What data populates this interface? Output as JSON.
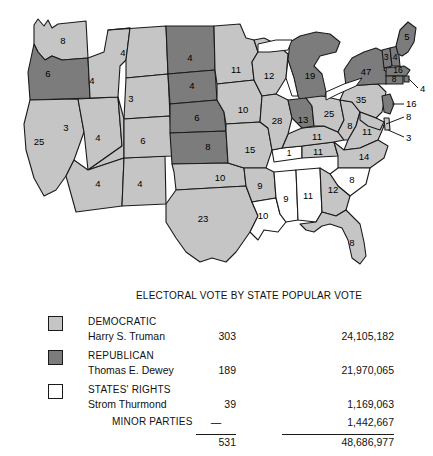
{
  "map": {
    "title": "1948 United States presidential election results by state",
    "colors": {
      "democratic": "#c5c5c5",
      "republican": "#7c7c7c",
      "states_rights": "#ffffff",
      "border": "#1a1a1a",
      "background": "#ffffff"
    },
    "states": [
      {
        "code": "WA",
        "label": "8",
        "party": "democratic",
        "x": 63,
        "y": 41
      },
      {
        "code": "OR",
        "label": "6",
        "party": "republican",
        "x": 48,
        "y": 74
      },
      {
        "code": "CA",
        "label": "25",
        "party": "democratic",
        "x": 39,
        "y": 142
      },
      {
        "code": "NV",
        "label": "3",
        "party": "democratic",
        "x": 66,
        "y": 128
      },
      {
        "code": "ID",
        "label": "4",
        "party": "democratic",
        "x": 92,
        "y": 81
      },
      {
        "code": "MT",
        "label": "4",
        "party": "democratic",
        "x": 123,
        "y": 53
      },
      {
        "code": "WY",
        "label": "3",
        "party": "democratic",
        "x": 131,
        "y": 99
      },
      {
        "code": "UT",
        "label": "4",
        "party": "democratic",
        "x": 98,
        "y": 138
      },
      {
        "code": "AZ",
        "label": "4",
        "party": "democratic",
        "x": 98,
        "y": 184
      },
      {
        "code": "NM",
        "label": "4",
        "party": "democratic",
        "x": 140,
        "y": 184
      },
      {
        "code": "CO",
        "label": "6",
        "party": "democratic",
        "x": 143,
        "y": 141
      },
      {
        "code": "ND",
        "label": "4",
        "party": "republican",
        "x": 190,
        "y": 58
      },
      {
        "code": "SD",
        "label": "4",
        "party": "republican",
        "x": 192,
        "y": 86
      },
      {
        "code": "NE",
        "label": "6",
        "party": "republican",
        "x": 197,
        "y": 118
      },
      {
        "code": "KS",
        "label": "8",
        "party": "republican",
        "x": 208,
        "y": 147
      },
      {
        "code": "OK",
        "label": "10",
        "party": "democratic",
        "x": 220,
        "y": 178
      },
      {
        "code": "TX",
        "label": "23",
        "party": "democratic",
        "x": 203,
        "y": 219
      },
      {
        "code": "MN",
        "label": "11",
        "party": "democratic",
        "x": 236,
        "y": 70
      },
      {
        "code": "IA",
        "label": "10",
        "party": "democratic",
        "x": 243,
        "y": 110
      },
      {
        "code": "MO",
        "label": "15",
        "party": "democratic",
        "x": 250,
        "y": 150
      },
      {
        "code": "AR",
        "label": "9",
        "party": "democratic",
        "x": 260,
        "y": 186
      },
      {
        "code": "LA",
        "label": "10",
        "party": "states_rights",
        "x": 263,
        "y": 216
      },
      {
        "code": "MS",
        "label": "9",
        "party": "states_rights",
        "x": 286,
        "y": 199
      },
      {
        "code": "AL",
        "label": "11",
        "party": "states_rights",
        "x": 308,
        "y": 196
      },
      {
        "code": "TN-sr",
        "label": "1",
        "party": "states_rights",
        "x": 289,
        "y": 172
      },
      {
        "code": "TN",
        "label": "11",
        "party": "democratic",
        "x": 316,
        "y": 171
      },
      {
        "code": "KY",
        "label": "11",
        "party": "democratic",
        "x": 317,
        "y": 148
      },
      {
        "code": "WI",
        "label": "12",
        "party": "democratic",
        "x": 269,
        "y": 76
      },
      {
        "code": "MI",
        "label": "19",
        "party": "republican",
        "x": 310,
        "y": 76
      },
      {
        "code": "IL",
        "label": "28",
        "party": "democratic",
        "x": 277,
        "y": 121
      },
      {
        "code": "IN",
        "label": "13",
        "party": "republican",
        "x": 303,
        "y": 122
      },
      {
        "code": "OH",
        "label": "25",
        "party": "democratic",
        "x": 329,
        "y": 117
      },
      {
        "code": "WV",
        "label": "8",
        "party": "democratic",
        "x": 348,
        "y": 131
      },
      {
        "code": "VA",
        "label": "11",
        "party": "democratic",
        "x": 365,
        "y": 142
      },
      {
        "code": "NC",
        "label": "14",
        "party": "democratic",
        "x": 370,
        "y": 160
      },
      {
        "code": "SC",
        "label": "8",
        "party": "states_rights",
        "x": 357,
        "y": 181
      },
      {
        "code": "GA",
        "label": "12",
        "party": "democratic",
        "x": 335,
        "y": 186
      },
      {
        "code": "FL",
        "label": "8",
        "party": "democratic",
        "x": 357,
        "y": 243
      },
      {
        "code": "PA",
        "label": "35",
        "party": "democratic",
        "x": 361,
        "y": 100
      },
      {
        "code": "NY",
        "label": "47",
        "party": "republican",
        "x": 370,
        "y": 73
      },
      {
        "code": "VT",
        "label": "3",
        "party": "republican",
        "x": 386,
        "y": 57
      },
      {
        "code": "NH",
        "label": "4",
        "party": "republican",
        "x": 396,
        "y": 60
      },
      {
        "code": "ME",
        "label": "5",
        "party": "republican",
        "x": 404,
        "y": 38
      }
    ],
    "callouts": [
      {
        "code": "MA",
        "label": "16",
        "x": 400,
        "y": 74
      },
      {
        "code": "CT",
        "label": "8",
        "x": 389,
        "y": 85
      },
      {
        "code": "RI",
        "label": "4",
        "x": 409,
        "y": 95
      },
      {
        "code": "NJ",
        "label": "16",
        "x": 405,
        "y": 104
      },
      {
        "code": "MD",
        "label": "8",
        "x": 405,
        "y": 117
      },
      {
        "code": "DE",
        "label": "3",
        "x": 405,
        "y": 129
      }
    ]
  },
  "legend": {
    "header_electoral": "ELECTORAL VOTE BY STATE",
    "header_popular": "POPULAR VOTE",
    "rows": [
      {
        "party": "DEMOCRATIC",
        "candidate": "Harry S. Truman",
        "electoral": "303",
        "popular": "24,105,182"
      },
      {
        "party": "REPUBLICAN",
        "candidate": "Thomas E. Dewey",
        "electoral": "189",
        "popular": "21,970,065"
      },
      {
        "party": "STATES' RIGHTS",
        "candidate": "Strom Thurmond",
        "electoral": "39",
        "popular": "1,169,063"
      }
    ],
    "minor": {
      "label": "MINOR PARTIES",
      "electoral": "—",
      "popular": "1,442,667"
    },
    "totals": {
      "electoral": "531",
      "popular": "48,686,977"
    }
  }
}
